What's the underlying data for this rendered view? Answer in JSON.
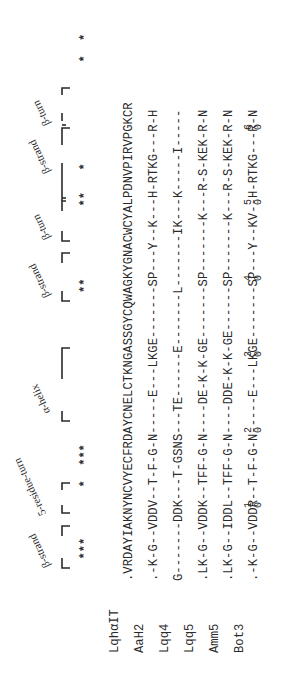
{
  "figure": {
    "type": "sequence_alignment",
    "orientation": "rotated-90-ccw",
    "conservation_stars": "   ***       *  ***                     **          **   *              *  *",
    "secondary_structure": [
      {
        "label": "β-strand",
        "start": 1,
        "end": 4
      },
      {
        "label": "5-residue-turn",
        "start": 5,
        "end": 10
      },
      {
        "label": "α-helix",
        "start": 19,
        "end": 29
      },
      {
        "label": "β-strand",
        "start": 36,
        "end": 39
      },
      {
        "label": "β-turn",
        "start": 40,
        "end": 44
      },
      {
        "label": "β-strand",
        "start": 45,
        "end": 52
      },
      {
        "label": "β-turn",
        "start": 53,
        "end": 57
      }
    ],
    "sequences": [
      {
        "name": "LqhαIT",
        "seq": ".VRDAYIAKNYNCVYECFRDAYCNELCTKNGASSGYCQWAGKYGNACWCYALPDNVPIRVPGKCR"
      },
      {
        "name": "AaH2",
        "seq": ".-K-G--VDDV--T-F-G-N-----E---LKGE-------SP---Y--K---H-RTKG---R-H"
      },
      {
        "name": "Lqq4",
        "seq": "G-------DDK---T-GSNS---TE------E-------L-------IK---K-----I-----"
      },
      {
        "name": "Lqq5",
        "seq": ".LK-G--VDDK--TFF-G-N----DE-K-K-GE-------SP-------K---R-S-KEK-R-N"
      },
      {
        "name": "Amm5",
        "seq": ".LK-G--IDDL--TFF-G-N----DDE-K-K-GE------SP-------K---R-S-KEK-R-N"
      },
      {
        "name": "Bot3",
        "seq": ".-K-G--VDDR--T-F-G-N-----E---LKGE-------SP---Y--KV--H-RTKG---R-N"
      }
    ],
    "position_ticks": [
      {
        "label": "1\n0",
        "pos": 10
      },
      {
        "label": "2\n0",
        "pos": 20
      },
      {
        "label": "3\n0",
        "pos": 30
      },
      {
        "label": "4\n0",
        "pos": 40
      },
      {
        "label": "5\n0",
        "pos": 50
      },
      {
        "label": "6\n0",
        "pos": 60
      }
    ]
  },
  "labels": {
    "ss_beta_strand_1": "β-strand",
    "ss_5res_turn": "5-residue-turn",
    "ss_alpha_helix": "α-helix",
    "ss_beta_strand_2": "β-strand",
    "ss_beta_turn_1": "β-turn",
    "ss_beta_strand_3": "β-strand",
    "ss_beta_turn_2": "β-turn",
    "stars": "   ***       *  ***                     **          **   *              *  *",
    "tick_1": "1",
    "tick_2": "2",
    "tick_3": "3",
    "tick_4": "4",
    "tick_5": "5",
    "tick_6": "6",
    "tick_0": "0"
  },
  "rows": {
    "r0": {
      "name": "LqhαIT",
      "seq": ".VRDAYIAKNYNCVYECFRDAYCNELCTKNGASSGYCQWAGKYGNACWCYALPDNVPIRVPGKCR"
    },
    "r1": {
      "name": "AaH2",
      "seq": ".-K-G--VDDV--T-F-G-N-----E---LKGE-------SP---Y--K---H-RTKG---R-H"
    },
    "r2": {
      "name": "Lqq4",
      "seq": "G-------DDK---T-GSNS---TE------E-------L-------IK---K-----I-----"
    },
    "r3": {
      "name": "Lqq5",
      "seq": ".LK-G--VDDK--TFF-G-N----DE-K-K-GE-------SP-------K---R-S-KEK-R-N"
    },
    "r4": {
      "name": "Amm5",
      "seq": ".LK-G--IDDL--TFF-G-N----DDE-K-K-GE------SP-------K---R-S-KEK-R-N"
    },
    "r5": {
      "name": "Bot3",
      "seq": ".-K-G--VDDR--T-F-G-N-----E---LKGE-------SP---Y--KV--H-RTKG---R-N"
    }
  }
}
